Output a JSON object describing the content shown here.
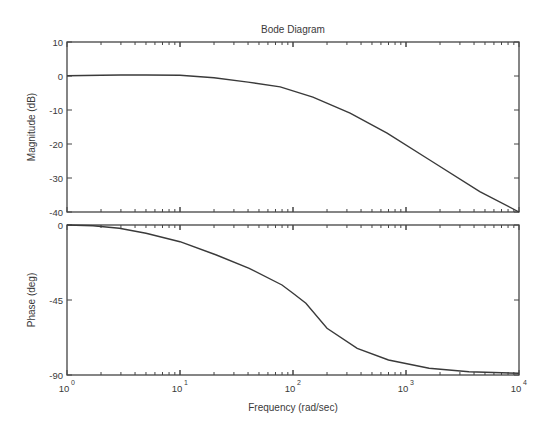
{
  "title": "Bode Diagram",
  "xlabel": "Frequency  (rad/sec)",
  "chart_data": [
    {
      "type": "line",
      "panel": "magnitude",
      "title": "Bode Diagram",
      "xlabel": "Frequency  (rad/sec)",
      "ylabel": "Magnitude (dB)",
      "xscale": "log",
      "xlim": [
        1,
        10000
      ],
      "ylim": [
        -40,
        10
      ],
      "yticks": [
        10,
        0,
        -10,
        -20,
        -30,
        -40
      ],
      "ytick_labels": [
        "10",
        "0",
        "-10",
        "-20",
        "-30",
        "-40"
      ],
      "grid": false,
      "series": [
        {
          "name": "magnitude",
          "x": [
            1,
            2,
            3,
            5,
            10,
            20,
            40,
            77,
            150,
            320,
            680,
            1620,
            4500,
            10000
          ],
          "values": [
            0.1,
            0.2,
            0.3,
            0.3,
            0.2,
            -0.5,
            -1.8,
            -3.2,
            -6.2,
            -10.9,
            -16.8,
            -24.7,
            -34,
            -40
          ]
        }
      ]
    },
    {
      "type": "line",
      "panel": "phase",
      "xlabel": "Frequency  (rad/sec)",
      "ylabel": "Phase (deg)",
      "xscale": "log",
      "xlim": [
        1,
        10000
      ],
      "ylim": [
        -90,
        0
      ],
      "yticks": [
        0,
        -45,
        -90
      ],
      "ytick_labels": [
        "0",
        "-45",
        "-90"
      ],
      "xticks": [
        1,
        10,
        100,
        1000,
        10000
      ],
      "xtick_labels": [
        "10^0",
        "10^1",
        "10^2",
        "10^3",
        "10^4"
      ],
      "grid": false,
      "series": [
        {
          "name": "phase",
          "x": [
            1,
            1.7,
            2.9,
            5,
            10,
            21,
            41,
            80,
            100,
            130,
            200,
            370,
            700,
            1600,
            3600,
            10000
          ],
          "values": [
            0,
            -0.5,
            -2,
            -5,
            -10,
            -18,
            -26,
            -36,
            -41,
            -47,
            -62,
            -74,
            -81,
            -86,
            -88,
            -89
          ]
        }
      ]
    }
  ]
}
